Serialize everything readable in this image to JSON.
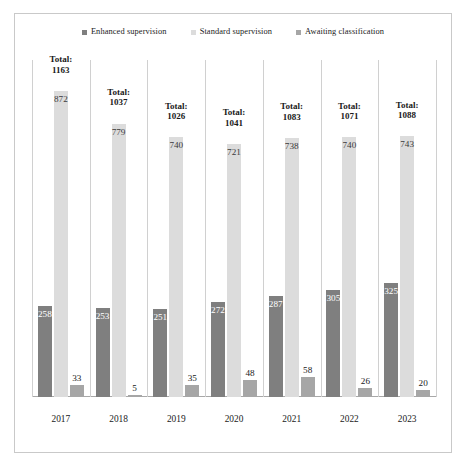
{
  "legend": {
    "position": "top-center",
    "items": [
      {
        "label": "Enhanced supervision",
        "color": "#7f7f7f",
        "icon": "square-swatch-icon"
      },
      {
        "label": "Standard supervision",
        "color": "#dcdcdc",
        "icon": "square-swatch-icon"
      },
      {
        "label": "Awaiting classification",
        "color": "#a6a6a6",
        "icon": "square-swatch-icon"
      }
    ]
  },
  "total_prefix": "Total:",
  "chart_data": {
    "type": "bar",
    "title": "",
    "xlabel": "",
    "ylabel": "",
    "grid": "vertical-category-separators",
    "ylim": [
      0,
      960
    ],
    "categories": [
      "2017",
      "2018",
      "2019",
      "2020",
      "2021",
      "2022",
      "2023"
    ],
    "series": [
      {
        "name": "Enhanced supervision",
        "color": "#7f7f7f",
        "values": [
          258,
          253,
          251,
          272,
          287,
          305,
          325
        ]
      },
      {
        "name": "Standard supervision",
        "color": "#dcdcdc",
        "values": [
          872,
          779,
          740,
          721,
          738,
          740,
          743
        ]
      },
      {
        "name": "Awaiting classification",
        "color": "#a6a6a6",
        "values": [
          33,
          5,
          35,
          48,
          58,
          26,
          20
        ]
      }
    ],
    "totals": [
      1163,
      1037,
      1026,
      1041,
      1083,
      1071,
      1088
    ],
    "annotations": [
      "Total: 1163",
      "Total: 1037",
      "Total: 1026",
      "Total: 1041",
      "Total: 1083",
      "Total: 1071",
      "Total: 1088"
    ]
  }
}
